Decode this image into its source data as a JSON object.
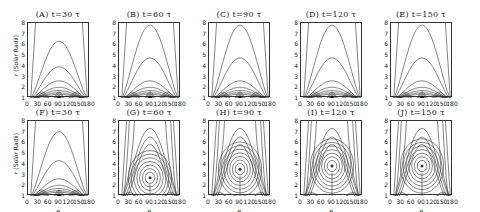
{
  "chart_data": {
    "type": "contour",
    "ylabel": "r (Solar Radii)",
    "xlabel": "θ",
    "x_ticks": [
      "0",
      "30",
      "60",
      "90",
      "120",
      "150",
      "180"
    ],
    "y_ticks": [
      "1",
      "2",
      "3",
      "4",
      "5",
      "6",
      "7",
      "8"
    ],
    "xlim": [
      0,
      180
    ],
    "ylim": [
      1,
      8
    ],
    "panels": [
      {
        "id": "A",
        "title": "(A) t=30 τ",
        "row": 1,
        "structure": "closed arcade loops, outer arch peak r≈6.3"
      },
      {
        "id": "B",
        "title": "(B) t=60 τ",
        "row": 1,
        "structure": "closed arcade loops, outer arch peak r≈8"
      },
      {
        "id": "C",
        "title": "(C) t=90 τ",
        "row": 1,
        "structure": "closed arcade loops, outer arch peak r≈8"
      },
      {
        "id": "D",
        "title": "(D) t=120 τ",
        "row": 1,
        "structure": "closed arcade loops, outer arch peak r≈8"
      },
      {
        "id": "E",
        "title": "(E) t=150 τ",
        "row": 1,
        "structure": "closed arcade loops, outer arch peak r≈8"
      },
      {
        "id": "F",
        "title": "(F) t=30 τ",
        "row": 2,
        "structure": "closed arcade loops, outer arch peak r≈7"
      },
      {
        "id": "G",
        "title": "(G) t=60 τ",
        "row": 2,
        "structure": "flux rope O-point at θ=90, r≈2.7"
      },
      {
        "id": "H",
        "title": "(H) t=90 τ",
        "row": 2,
        "structure": "flux rope O-point at θ=90, r≈3.5"
      },
      {
        "id": "I",
        "title": "(I) t=120 τ",
        "row": 2,
        "structure": "flux rope O-point at θ=90, r≈3.8"
      },
      {
        "id": "J",
        "title": "(J) t=150 τ",
        "row": 2,
        "structure": "flux rope O-point at θ=90, r≈3.8"
      }
    ]
  }
}
